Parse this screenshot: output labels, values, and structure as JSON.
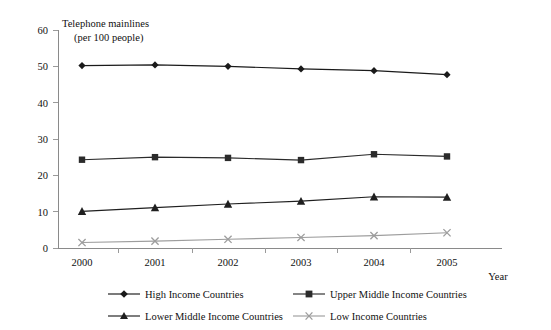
{
  "chart_data": {
    "type": "line",
    "title": "Telephone mainlines",
    "subtitle": "(per 100 people)",
    "xlabel": "Year",
    "ylabel": "",
    "categories": [
      "2000",
      "2001",
      "2002",
      "2003",
      "2004",
      "2005"
    ],
    "ylim": [
      0,
      60
    ],
    "yticks": [
      0,
      10,
      20,
      30,
      40,
      50,
      60
    ],
    "grid": false,
    "legend_position": "bottom",
    "series": [
      {
        "name": "High Income Countries",
        "marker": "diamond",
        "color": "#1a1a1a",
        "values": [
          50.2,
          50.4,
          50.0,
          49.3,
          48.8,
          47.7
        ]
      },
      {
        "name": "Upper Middle Income Countries",
        "marker": "square",
        "color": "#2b2b2b",
        "values": [
          24.3,
          25.0,
          24.8,
          24.2,
          25.8,
          25.2
        ]
      },
      {
        "name": "Lower Middle Income Countries",
        "marker": "triangle",
        "color": "#1f1f1f",
        "values": [
          10.1,
          11.1,
          12.1,
          12.9,
          14.1,
          14.0
        ]
      },
      {
        "name": "Low Income Countries",
        "marker": "cross",
        "color": "#9d9d9d",
        "values": [
          1.5,
          1.9,
          2.4,
          2.9,
          3.4,
          4.2
        ]
      }
    ]
  },
  "legend": {
    "entries": [
      "High Income Countries",
      "Upper Middle Income Countries",
      "Lower Middle Income Countries",
      "Low Income Countries"
    ]
  },
  "axis_labels": {
    "y_0": "0",
    "y_10": "10",
    "y_20": "20",
    "y_30": "30",
    "y_40": "40",
    "y_50": "50",
    "y_60": "60",
    "x_2000": "2000",
    "x_2001": "2001",
    "x_2002": "2002",
    "x_2003": "2003",
    "x_2004": "2004",
    "x_2005": "2005",
    "x_axis_title": "Year"
  }
}
